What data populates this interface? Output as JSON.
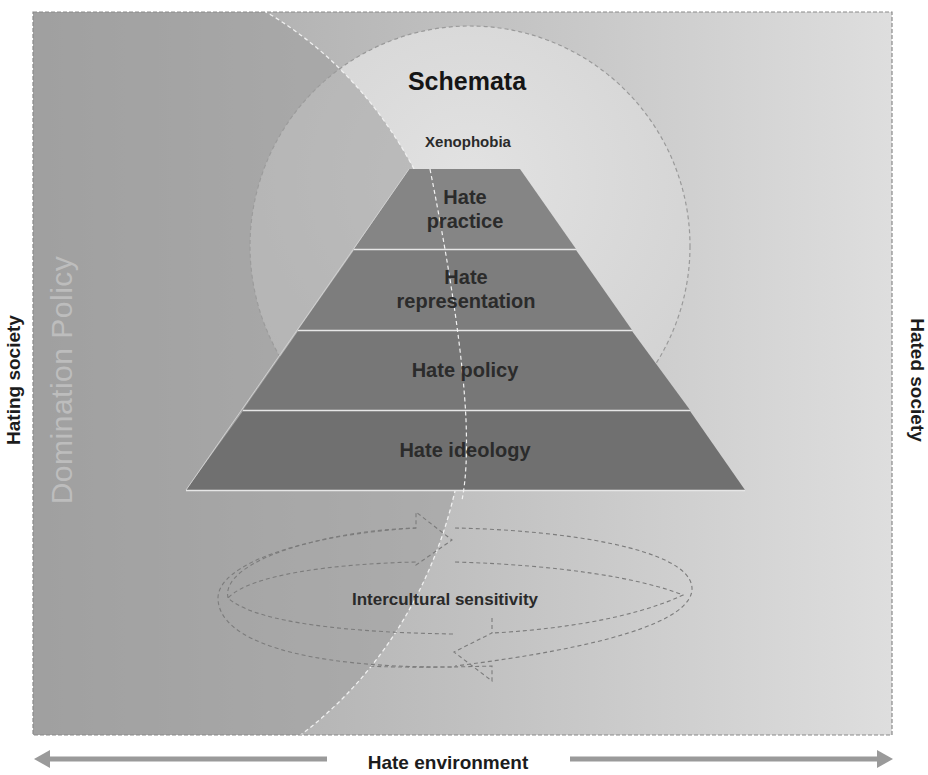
{
  "diagram": {
    "frame_label_left": "Hating society",
    "frame_label_right": "Hated society",
    "bottom_axis_label": "Hate environment",
    "left_region_label": "Domination Policy",
    "circle_title": "Schemata",
    "circle_subtitle": "Xenophobia",
    "pyramid_layers": [
      {
        "line1": "Hate",
        "line2": "practice"
      },
      {
        "line1": "Hate",
        "line2": "representation"
      },
      {
        "line1": "Hate policy",
        "line2": ""
      },
      {
        "line1": "Hate ideology",
        "line2": ""
      }
    ],
    "cycle_label": "Intercultural sensitivity",
    "arrows": {
      "bottom_left": "arrow-left",
      "bottom_right": "arrow-right",
      "cycle": "circular-arrows"
    },
    "colors": {
      "frame_left_bg": "#a3a3a3",
      "frame_right_bg": "#dcdcdc",
      "domination_region": "#a0a0a0",
      "schemata_circle": "#d9d9d9",
      "pyramid_layer": "#7a7a7a",
      "axis_arrow": "#999999",
      "text": "#1c1c1c"
    }
  }
}
